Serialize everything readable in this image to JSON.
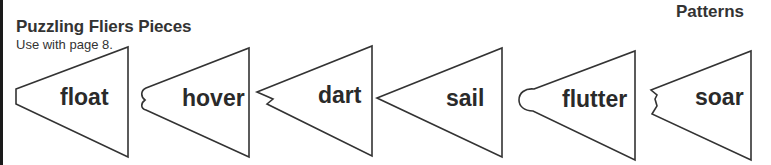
{
  "header": {
    "title": "Puzzling Fliers Pieces",
    "subtitle": "Use with page 8.",
    "section": "Patterns"
  },
  "pieces": [
    {
      "word": "float",
      "tip_shape": "flat"
    },
    {
      "word": "hover",
      "tip_shape": "double-bump"
    },
    {
      "word": "dart",
      "tip_shape": "zigzag"
    },
    {
      "word": "sail",
      "tip_shape": "point"
    },
    {
      "word": "flutter",
      "tip_shape": "rounded"
    },
    {
      "word": "soar",
      "tip_shape": "notch"
    }
  ],
  "colors": {
    "outline": "#333333",
    "text": "#2a2a2a",
    "background": "#ffffff"
  }
}
